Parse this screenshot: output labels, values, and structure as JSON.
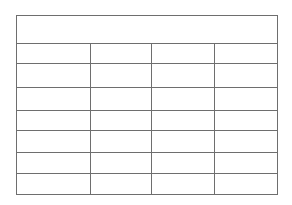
{
  "document": {
    "type": "blank-table",
    "background_color": "#ffffff",
    "line_color": "#6e6e6e"
  },
  "table": {
    "header": {
      "merged": true,
      "label": ""
    },
    "columns": [
      {
        "key": "col1",
        "header": ""
      },
      {
        "key": "col2",
        "header": ""
      },
      {
        "key": "col3",
        "header": ""
      },
      {
        "key": "col4",
        "header": ""
      }
    ],
    "rows": [
      {
        "cells": [
          "",
          "",
          "",
          ""
        ]
      },
      {
        "cells": [
          "",
          "",
          "",
          ""
        ]
      },
      {
        "cells": [
          "",
          "",
          "",
          ""
        ]
      },
      {
        "cells": [
          "",
          "",
          "",
          ""
        ]
      },
      {
        "cells": [
          "",
          "",
          "",
          ""
        ]
      },
      {
        "cells": [
          "",
          "",
          "",
          ""
        ]
      },
      {
        "cells": [
          "",
          "",
          "",
          ""
        ]
      }
    ]
  }
}
